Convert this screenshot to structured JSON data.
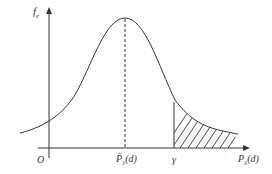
{
  "diagram": {
    "title": "",
    "y_axis_label": "f",
    "y_axis_label_sub": "e",
    "origin_label": "O",
    "mean_label": "P̄",
    "mean_label_sub": "λ",
    "mean_label_tail": "(d)",
    "threshold_label": "γ",
    "x_axis_label": "P",
    "x_axis_label_sub": "λ",
    "x_axis_label_tail": "(d)",
    "elements": [
      "bell-shaped probability density curve",
      "dashed vertical line at mean",
      "vertical line at threshold γ",
      "hatched tail region right of γ"
    ],
    "colors": {
      "stroke": "#333333",
      "background": "#ffffff"
    }
  }
}
